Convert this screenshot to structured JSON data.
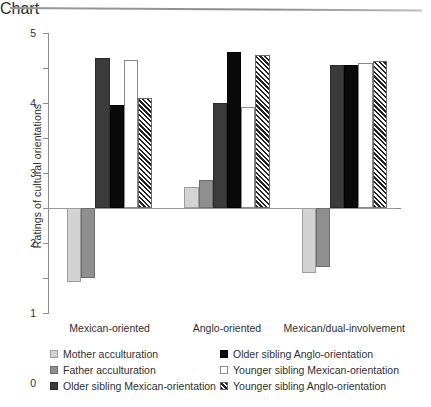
{
  "chart_data": {
    "type": "bar",
    "title": "",
    "xlabel": "",
    "ylabel": "Ratings of cultural orientations",
    "ylim": [
      -3,
      5
    ],
    "yticks": [
      5,
      4,
      3,
      2,
      1,
      0,
      -1,
      -2,
      -3
    ],
    "ytick_labels": [
      "5",
      "4",
      "3",
      "2",
      "1",
      "0",
      "-1",
      "-2",
      "-3"
    ],
    "grid": false,
    "legend_position": "bottom",
    "categories": [
      "Mexican-oriented",
      "Anglo-oriented",
      "Mexican/dual-involvement"
    ],
    "series": [
      {
        "name": "Mother acculturation",
        "style": "light-gray",
        "color": "#d3d3d3",
        "values": [
          -2.1,
          0.6,
          -1.85
        ]
      },
      {
        "name": "Father acculturation",
        "style": "medium-gray",
        "color": "#8f8f8f",
        "values": [
          -2.0,
          0.8,
          -1.68
        ]
      },
      {
        "name": "Older sibling Mexican-orientation",
        "style": "dark-gray",
        "color": "#3b3b3b",
        "values": [
          4.3,
          3.0,
          4.1
        ]
      },
      {
        "name": "Older sibling Anglo-orientation",
        "style": "black",
        "color": "#0a0a0a",
        "values": [
          2.95,
          4.45,
          4.1
        ]
      },
      {
        "name": "Younger sibling Mexican-orientation",
        "style": "white-outline",
        "color": "#ffffff",
        "values": [
          4.22,
          2.88,
          4.15
        ]
      },
      {
        "name": "Younger sibling Anglo-orientation",
        "style": "diagonal-hatch",
        "color": "#232323",
        "values": [
          3.15,
          4.38,
          4.2
        ]
      }
    ]
  },
  "legend": {
    "columns": [
      {
        "items": [
          {
            "label": "Mother acculturation",
            "swatch": "light-gray-swatch"
          },
          {
            "label": "Father acculturation",
            "swatch": "medium-gray-swatch"
          },
          {
            "label": "Older sibling Mexican-orientation",
            "swatch": "dark-gray-swatch"
          }
        ]
      },
      {
        "items": [
          {
            "label": "Older sibling Anglo-orientation",
            "swatch": "black-swatch"
          },
          {
            "label": "Younger sibling Mexican-orientation",
            "swatch": "white-outline-swatch"
          },
          {
            "label": "Younger sibling Anglo-orientation",
            "swatch": "hatched-swatch"
          }
        ]
      }
    ]
  }
}
